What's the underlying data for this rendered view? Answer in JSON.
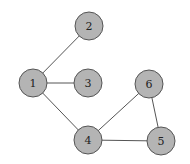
{
  "graph": {
    "nodes": [
      {
        "id": "1",
        "label": "1",
        "x": 33,
        "y": 83
      },
      {
        "id": "2",
        "label": "2",
        "x": 89,
        "y": 26
      },
      {
        "id": "3",
        "label": "3",
        "x": 88,
        "y": 83
      },
      {
        "id": "4",
        "label": "4",
        "x": 88,
        "y": 140
      },
      {
        "id": "5",
        "label": "5",
        "x": 161,
        "y": 141
      },
      {
        "id": "6",
        "label": "6",
        "x": 149,
        "y": 84
      }
    ],
    "edges": [
      {
        "from": "1",
        "to": "2"
      },
      {
        "from": "1",
        "to": "3"
      },
      {
        "from": "1",
        "to": "4"
      },
      {
        "from": "4",
        "to": "6"
      },
      {
        "from": "4",
        "to": "5"
      },
      {
        "from": "6",
        "to": "5"
      }
    ],
    "node_radius": 14,
    "colors": {
      "node_fill": "#b4b4b4",
      "node_stroke": "#555555",
      "edge": "#555555",
      "label": "#222222"
    }
  }
}
